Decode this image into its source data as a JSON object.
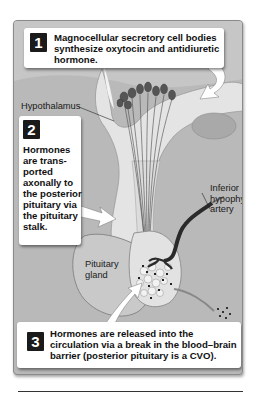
{
  "figure": {
    "callouts": [
      {
        "number": "1",
        "text": "Magnocellular secretory cell bodies synthesize oxytocin and antidiuretic hormone."
      },
      {
        "number": "2",
        "text": "Hormones are trans-ported axonally to the posterior pituitary via the pituitary stalk."
      },
      {
        "number": "3",
        "text": "Hormones are released into the circulation via a break in the blood–brain barrier (posterior pituitary is a CVO)."
      }
    ],
    "labels": {
      "hypothalamus": "Hypothalamus",
      "pituitary_gland_line1": "Pituitary",
      "pituitary_gland_line2": "gland",
      "artery_line1": "Inferior",
      "artery_line2": "hypophyseal",
      "artery_line3": "artery"
    },
    "colors": {
      "panel_background": "#b9b9b9",
      "callout_background": "#ffffff",
      "number_badge": "#1a1a1a",
      "tissue_light": "#e6e6e6",
      "vessel_dark": "#2a2a2a"
    }
  }
}
